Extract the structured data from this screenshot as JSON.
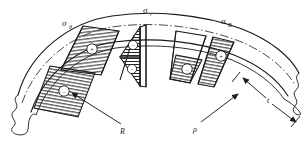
{
  "figure": {
    "type": "engineering-stress-diagram",
    "background_color": "#ffffff",
    "line_color": "#1a1a1a",
    "hatch_color": "#262626"
  },
  "labels": {
    "hoop_stress": {
      "symbol": "σ",
      "subscript": "θ",
      "x": 62,
      "y": 24
    },
    "radial_stress": {
      "symbol": "σ",
      "subscript": "r",
      "x": 146,
      "y": 12
    },
    "bending_stress": {
      "symbol": "σ",
      "subscript": "B",
      "x": 222,
      "y": 22
    },
    "radius_R": {
      "symbol": "R",
      "x": 121,
      "y": 131
    },
    "radius_rho": {
      "symbol": "ρ",
      "x": 196,
      "y": 130
    },
    "thickness": {
      "symbol": "t",
      "x": 268,
      "y": 100
    }
  },
  "sign_markers": {
    "plus": "+",
    "minus": "−",
    "items": [
      {
        "name": "left-upper-block-sign",
        "sign": "+",
        "x": 97,
        "y": 44
      },
      {
        "name": "left-lower-block-sign",
        "sign": "−",
        "x": 81,
        "y": 83
      },
      {
        "name": "center-upper-wedge-sign",
        "sign": "−",
        "x": 146,
        "y": 45
      },
      {
        "name": "center-lower-wedge-sign",
        "sign": "−",
        "x": 146,
        "y": 68
      },
      {
        "name": "right-outer-block-sign",
        "sign": "+",
        "x": 224,
        "y": 48
      },
      {
        "name": "right-inner-block-sign",
        "sign": "−",
        "x": 196,
        "y": 70
      }
    ]
  },
  "geometry": {
    "outer_arc": "M 18,95 C 30,52 70,22 112,16 C 150,11 200,14 240,28 C 268,38 288,54 298,72",
    "inner_arc": "M 30,110 C 44,72 78,46 114,41 C 152,36 196,40 232,54 C 258,64 276,78 286,94",
    "center_arc": "M 24,102 C 37,62 74,34 113,28 C 151,23 198,27 236,41 C 263,51 282,66 292,83",
    "break_left": "M 18,95 C 12,100 24,106 16,112 C 9,117 22,122 16,128 C 11,133 22,136 26,134 C 30,118 28,113 30,110",
    "break_right": "M 298,72 C 292,78 302,84 295,90 C 289,96 300,101 294,107 C 290,112 298,116 300,113 C 296,102 290,98 286,94"
  },
  "blocks": {
    "left_upper": {
      "name": "hoop-stress-block-upper",
      "points": "78,60 83,27 119,31 112,64",
      "hatch": "horizontal"
    },
    "left_lower": {
      "name": "hoop-stress-block-lower",
      "points": "55,106 62,70 104,75 97,113",
      "hatch": "horizontal"
    },
    "center_upper": {
      "name": "radial-stress-wedge-upper",
      "points": "140,28 152,29 152,57 140,57",
      "hatch": "horizontal"
    },
    "center_lower": {
      "name": "radial-stress-wedge-lower",
      "points": "140,58 152,58 152,84 140,84",
      "hatch": "horizontal"
    },
    "right_outer": {
      "name": "bending-stress-block-outer",
      "points": "214,36 233,40 228,68 210,63",
      "hatch": "horizontal"
    },
    "right_inner": {
      "name": "bending-stress-block-inner",
      "points": "181,55 206,61 202,86 177,79",
      "hatch": "horizontal"
    }
  },
  "leaders": {
    "R_leader": "M 118,126 L 77,96",
    "rho_leader": "M 198,124 L 238,95",
    "thickness_upper": "M 262,95 L 240,76",
    "thickness_lower": "M 272,105 L 292,121"
  },
  "radial_lines": [
    {
      "name": "radial-line-left",
      "d": "M 78,60 L 55,106"
    },
    {
      "name": "radial-line-center",
      "d": "M 146,26 L 146,86"
    },
    {
      "name": "radial-line-right-a",
      "d": "M 214,36 L 181,55"
    },
    {
      "name": "radial-line-right-b",
      "d": "M 233,40 L 206,61"
    }
  ]
}
